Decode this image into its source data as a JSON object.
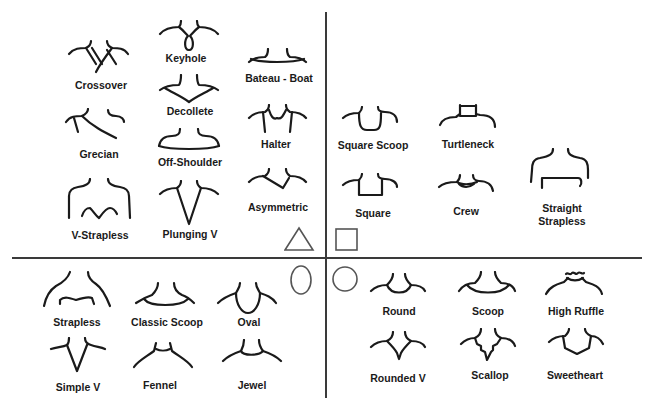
{
  "diagram": {
    "colors": {
      "background": "#ffffff",
      "ink": "#1a1a1a",
      "divider": "#3a3a3a",
      "shape_outline": "#555555"
    },
    "quadrants": {
      "top_left": {
        "face_shape_icon": "triangle",
        "necklines": [
          {
            "id": "crossover",
            "label": "Crossover"
          },
          {
            "id": "keyhole",
            "label": "Keyhole"
          },
          {
            "id": "bateau",
            "label": "Bateau - Boat"
          },
          {
            "id": "decollete",
            "label": "Decollete"
          },
          {
            "id": "grecian",
            "label": "Grecian"
          },
          {
            "id": "off-shoulder",
            "label": "Off-Shoulder"
          },
          {
            "id": "halter",
            "label": "Halter"
          },
          {
            "id": "asymmetric",
            "label": "Asymmetric"
          },
          {
            "id": "v-strapless",
            "label": "V-Strapless"
          },
          {
            "id": "plunging-v",
            "label": "Plunging V"
          }
        ]
      },
      "top_right": {
        "face_shape_icon": "square",
        "necklines": [
          {
            "id": "square-scoop",
            "label": "Square Scoop"
          },
          {
            "id": "turtleneck",
            "label": "Turtleneck"
          },
          {
            "id": "square",
            "label": "Square"
          },
          {
            "id": "crew",
            "label": "Crew"
          },
          {
            "id": "straight-strapless",
            "label": "Straight",
            "label2": "Strapless"
          }
        ]
      },
      "bottom_left": {
        "face_shape_icon": "oval",
        "necklines": [
          {
            "id": "strapless",
            "label": "Strapless"
          },
          {
            "id": "classic-scoop",
            "label": "Classic Scoop"
          },
          {
            "id": "oval",
            "label": "Oval"
          },
          {
            "id": "simple-v",
            "label": "Simple V"
          },
          {
            "id": "fennel",
            "label": "Fennel"
          },
          {
            "id": "jewel",
            "label": "Jewel"
          }
        ]
      },
      "bottom_right": {
        "face_shape_icon": "circle",
        "necklines": [
          {
            "id": "round",
            "label": "Round"
          },
          {
            "id": "scoop",
            "label": "Scoop"
          },
          {
            "id": "high-ruffle",
            "label": "High Ruffle"
          },
          {
            "id": "rounded-v",
            "label": "Rounded V"
          },
          {
            "id": "scallop",
            "label": "Scallop"
          },
          {
            "id": "sweetheart",
            "label": "Sweetheart"
          }
        ]
      }
    }
  }
}
